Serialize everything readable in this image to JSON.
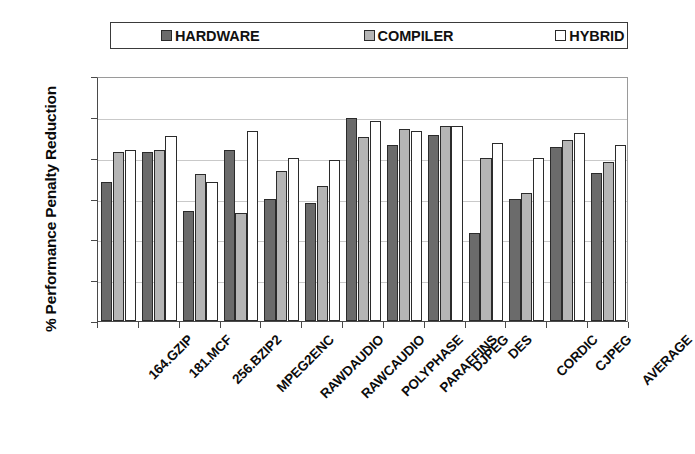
{
  "chart_data": {
    "type": "bar",
    "title": "",
    "xlabel": "",
    "ylabel": "% Performance Penalty Reduction",
    "ylim": [
      0,
      120
    ],
    "yticks": [
      0,
      20,
      40,
      60,
      80,
      100,
      120
    ],
    "grid": true,
    "legend_position": "top",
    "categories": [
      "164.GZIP",
      "181.MCF",
      "256.BZIP2",
      "MPEG2ENC",
      "RAWDAUDIO",
      "RAWCAUDIO",
      "POLYPHASE",
      "PARAFFINS",
      "DJPEG",
      "DES",
      "CORDIC",
      "CJPEG",
      "AVERAGE"
    ],
    "series": [
      {
        "name": "HARDWARE",
        "color": "#6b6b6b",
        "values": [
          68,
          83,
          54,
          84,
          60,
          58,
          99.5,
          86,
          91,
          43,
          60,
          85,
          72.5
        ]
      },
      {
        "name": "COMPILER",
        "color": "#b5b5b5",
        "values": [
          83,
          84,
          72,
          53,
          73.5,
          66,
          90,
          94,
          95.5,
          80,
          62.5,
          88.5,
          78
        ]
      },
      {
        "name": "HYBRID",
        "color": "#ffffff",
        "values": [
          84,
          90.5,
          68,
          93,
          80,
          79,
          98,
          93,
          95.5,
          87,
          80,
          92,
          86
        ]
      }
    ]
  },
  "legend": {
    "entries": [
      {
        "label": "HARDWARE",
        "color": "#6b6b6b"
      },
      {
        "label": "COMPILER",
        "color": "#b5b5b5"
      },
      {
        "label": "HYBRID",
        "color": "#ffffff"
      }
    ]
  },
  "axes": {
    "y_title": "% Performance Penalty Reduction",
    "y_tick_labels": [
      "120",
      "100",
      "80",
      "60",
      "40",
      "20",
      "0"
    ]
  }
}
